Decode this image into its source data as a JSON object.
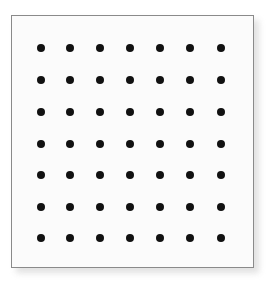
{
  "figure": {
    "name": "dot-grid-figure",
    "canvas_width": 267,
    "canvas_height": 282,
    "background_color": "#ffffff"
  },
  "panel": {
    "name": "dot-grid-panel",
    "x": 11,
    "y": 15,
    "width": 243,
    "height": 253,
    "fill_color": "#fbfbfb",
    "border_color": "#8a8a8a",
    "border_width": 1,
    "shadow_color": "#c9c9c9",
    "shadow_offset_x": 5,
    "shadow_offset_y": 5
  },
  "chart_data": {
    "type": "scatter",
    "title": "",
    "subtitle": "",
    "xlabel": "",
    "ylabel": "",
    "grid": false,
    "legend": "none",
    "rows": 7,
    "columns": 7,
    "point_count": 49,
    "point_color": "#111111",
    "point_diameter": 8,
    "xlim": [
      0,
      243
    ],
    "ylim": [
      0,
      253
    ],
    "x": [
      29,
      58,
      88,
      118,
      148,
      178,
      209
    ],
    "y": [
      32,
      64,
      96,
      128,
      159,
      191,
      222
    ],
    "points": [
      {
        "row": 1,
        "col": 1,
        "x": 29,
        "y": 32
      },
      {
        "row": 1,
        "col": 2,
        "x": 58,
        "y": 32
      },
      {
        "row": 1,
        "col": 3,
        "x": 88,
        "y": 32
      },
      {
        "row": 1,
        "col": 4,
        "x": 118,
        "y": 32
      },
      {
        "row": 1,
        "col": 5,
        "x": 148,
        "y": 32
      },
      {
        "row": 1,
        "col": 6,
        "x": 178,
        "y": 32
      },
      {
        "row": 1,
        "col": 7,
        "x": 209,
        "y": 32
      },
      {
        "row": 2,
        "col": 1,
        "x": 29,
        "y": 64
      },
      {
        "row": 2,
        "col": 2,
        "x": 58,
        "y": 64
      },
      {
        "row": 2,
        "col": 3,
        "x": 88,
        "y": 64
      },
      {
        "row": 2,
        "col": 4,
        "x": 118,
        "y": 64
      },
      {
        "row": 2,
        "col": 5,
        "x": 148,
        "y": 64
      },
      {
        "row": 2,
        "col": 6,
        "x": 178,
        "y": 64
      },
      {
        "row": 2,
        "col": 7,
        "x": 209,
        "y": 64
      },
      {
        "row": 3,
        "col": 1,
        "x": 29,
        "y": 96
      },
      {
        "row": 3,
        "col": 2,
        "x": 58,
        "y": 96
      },
      {
        "row": 3,
        "col": 3,
        "x": 88,
        "y": 96
      },
      {
        "row": 3,
        "col": 4,
        "x": 118,
        "y": 96
      },
      {
        "row": 3,
        "col": 5,
        "x": 148,
        "y": 96
      },
      {
        "row": 3,
        "col": 6,
        "x": 178,
        "y": 96
      },
      {
        "row": 3,
        "col": 7,
        "x": 209,
        "y": 96
      },
      {
        "row": 4,
        "col": 1,
        "x": 29,
        "y": 128
      },
      {
        "row": 4,
        "col": 2,
        "x": 58,
        "y": 128
      },
      {
        "row": 4,
        "col": 3,
        "x": 88,
        "y": 128
      },
      {
        "row": 4,
        "col": 4,
        "x": 118,
        "y": 128
      },
      {
        "row": 4,
        "col": 5,
        "x": 148,
        "y": 128
      },
      {
        "row": 4,
        "col": 6,
        "x": 178,
        "y": 128
      },
      {
        "row": 4,
        "col": 7,
        "x": 209,
        "y": 128
      },
      {
        "row": 5,
        "col": 1,
        "x": 29,
        "y": 159
      },
      {
        "row": 5,
        "col": 2,
        "x": 58,
        "y": 159
      },
      {
        "row": 5,
        "col": 3,
        "x": 88,
        "y": 159
      },
      {
        "row": 5,
        "col": 4,
        "x": 118,
        "y": 159
      },
      {
        "row": 5,
        "col": 5,
        "x": 148,
        "y": 159
      },
      {
        "row": 5,
        "col": 6,
        "x": 178,
        "y": 159
      },
      {
        "row": 5,
        "col": 7,
        "x": 209,
        "y": 159
      },
      {
        "row": 6,
        "col": 1,
        "x": 29,
        "y": 191
      },
      {
        "row": 6,
        "col": 2,
        "x": 58,
        "y": 191
      },
      {
        "row": 6,
        "col": 3,
        "x": 88,
        "y": 191
      },
      {
        "row": 6,
        "col": 4,
        "x": 118,
        "y": 191
      },
      {
        "row": 6,
        "col": 5,
        "x": 148,
        "y": 191
      },
      {
        "row": 6,
        "col": 6,
        "x": 178,
        "y": 191
      },
      {
        "row": 6,
        "col": 7,
        "x": 209,
        "y": 191
      },
      {
        "row": 7,
        "col": 1,
        "x": 29,
        "y": 222
      },
      {
        "row": 7,
        "col": 2,
        "x": 58,
        "y": 222
      },
      {
        "row": 7,
        "col": 3,
        "x": 88,
        "y": 222
      },
      {
        "row": 7,
        "col": 4,
        "x": 118,
        "y": 222
      },
      {
        "row": 7,
        "col": 5,
        "x": 148,
        "y": 222
      },
      {
        "row": 7,
        "col": 6,
        "x": 178,
        "y": 222
      },
      {
        "row": 7,
        "col": 7,
        "x": 209,
        "y": 222
      }
    ]
  }
}
